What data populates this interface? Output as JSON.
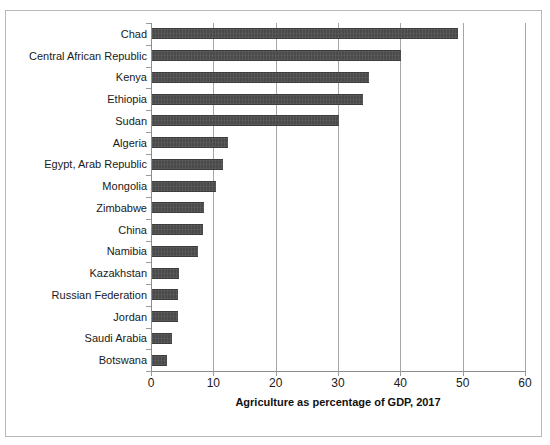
{
  "chart_data": {
    "type": "bar",
    "orientation": "horizontal",
    "title": "",
    "xlabel": "Agriculture as percentage of GDP, 2017",
    "ylabel": "",
    "xlim": [
      0,
      60
    ],
    "xticks": [
      0,
      10,
      20,
      30,
      40,
      50,
      60
    ],
    "grid": "vertical",
    "legend": "none",
    "bar_color": "#4a4a4a",
    "categories": [
      "Chad",
      "Central African Republic",
      "Kenya",
      "Ethiopia",
      "Sudan",
      "Algeria",
      "Egypt, Arab Republic",
      "Mongolia",
      "Zimbabwe",
      "China",
      "Namibia",
      "Kazakhstan",
      "Russian Federation",
      "Jordan",
      "Saudi Arabia",
      "Botswana"
    ],
    "values": [
      49.3,
      40.1,
      35.0,
      34.0,
      30.2,
      12.4,
      11.6,
      10.4,
      8.5,
      8.4,
      7.5,
      4.5,
      4.4,
      4.4,
      3.4,
      2.5
    ]
  }
}
